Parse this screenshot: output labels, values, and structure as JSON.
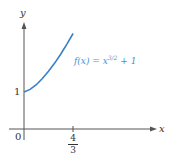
{
  "chart_data": {
    "type": "line",
    "title": "",
    "xlabel": "x",
    "ylabel": "y",
    "series": [
      {
        "name": "f(x) = x^{3/2} + 1",
        "x": [
          0,
          0.1667,
          0.3333,
          0.5,
          0.6667,
          0.8333,
          1.0,
          1.1667,
          1.3333
        ],
        "values": [
          1.0,
          1.068,
          1.192,
          1.354,
          1.544,
          1.761,
          2.0,
          2.26,
          2.54
        ]
      }
    ],
    "x_ticks": [
      "0",
      "4/3"
    ],
    "y_ticks": [
      "1"
    ],
    "xlim": [
      0,
      3.6
    ],
    "ylim": [
      0,
      3.4
    ],
    "grid": false,
    "annotation": "f(x) = x^{3/2} + 1",
    "curve_color": "#3a7fc8"
  },
  "labels": {
    "y_axis": "y",
    "x_axis": "x",
    "origin": "0",
    "y_one": "1",
    "x_frac_num": "4",
    "x_frac_den": "3",
    "func_prefix": "f(x) = x",
    "func_exp": "3/2",
    "func_suffix": " + 1"
  }
}
